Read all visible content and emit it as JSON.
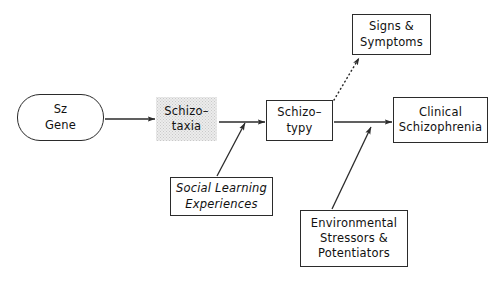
{
  "diagram": {
    "background_color": "#ffffff",
    "line_color": "#2b2b2b",
    "shaded_fill_color": "#ececec",
    "nodes": {
      "sz_gene": {
        "line1": "Sz",
        "line2": "Gene",
        "shape": "rounded-rectangle"
      },
      "schizotaxia": {
        "line1": "Schizo–",
        "line2": "taxia",
        "shape": "shaded-rectangle"
      },
      "schizotypy": {
        "line1": "Schizo–",
        "line2": "typy",
        "shape": "rectangle"
      },
      "clinical_schizophrenia": {
        "line1": "Clinical",
        "line2": "Schizophrenia",
        "shape": "rectangle"
      },
      "signs_symptoms": {
        "line1": "Signs  &",
        "line2": "Symptoms",
        "shape": "rectangle"
      },
      "social_learning": {
        "line1": "Social  Learning",
        "line2": "Experiences",
        "shape": "rectangle-italic"
      },
      "environmental": {
        "line1": "Environmental",
        "line2": "Stressors  &",
        "line3": "Potentiators",
        "shape": "rectangle"
      }
    },
    "edges": [
      {
        "id": "sz-gene-to-schizotaxia",
        "from": "sz_gene",
        "to": "schizotaxia",
        "style": "solid",
        "arrow": "single"
      },
      {
        "id": "schizotaxia-to-schizotypy",
        "from": "schizotaxia",
        "to": "schizotypy",
        "style": "solid",
        "arrow": "single"
      },
      {
        "id": "social-learning-to-schizotaxia-path",
        "from": "social_learning",
        "to": "schizotaxia_schizotypy_link",
        "style": "solid",
        "arrow": "single"
      },
      {
        "id": "schizotypy-to-signs-symptoms",
        "from": "schizotypy",
        "to": "signs_symptoms",
        "style": "dotted",
        "arrow": "single"
      },
      {
        "id": "schizotypy-to-clinical",
        "from": "schizotypy",
        "to": "clinical_schizophrenia",
        "style": "solid",
        "arrow": "single"
      },
      {
        "id": "environmental-to-clinical-path",
        "from": "environmental",
        "to": "schizotypy_clinical_link",
        "style": "solid",
        "arrow": "single"
      }
    ]
  }
}
